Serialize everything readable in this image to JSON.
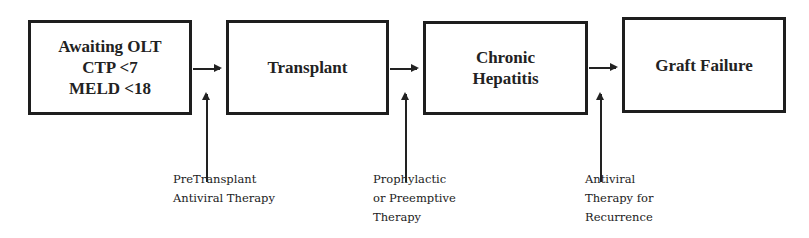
{
  "diagram": {
    "type": "flowchart",
    "direction": "left-to-right",
    "stages": [
      {
        "id": "awaiting",
        "lines": [
          "Awaiting OLT",
          "CTP <7",
          "MELD <18"
        ]
      },
      {
        "id": "transplant",
        "lines": [
          "Transplant"
        ]
      },
      {
        "id": "chronic",
        "lines": [
          "Chronic",
          "Hepatitis"
        ]
      },
      {
        "id": "graft",
        "lines": [
          "Graft Failure"
        ]
      }
    ],
    "interventions": [
      {
        "id": "pretransplant",
        "lines": [
          "PreTransplant",
          "Antiviral Therapy"
        ],
        "targets": "awaiting-to-transplant"
      },
      {
        "id": "prophylactic",
        "lines": [
          "Prophylactic",
          "or Preemptive",
          "Therapy"
        ],
        "targets": "transplant-to-chronic"
      },
      {
        "id": "recurrence",
        "lines": [
          "Antiviral",
          "Therapy for",
          "Recurrence"
        ],
        "targets": "chronic-to-graft"
      }
    ]
  },
  "colors": {
    "stroke": "#1e1e1e",
    "text": "#222222",
    "background": "#ffffff",
    "ghost_text": "#ececec"
  }
}
